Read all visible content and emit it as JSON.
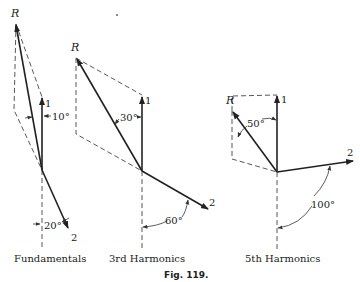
{
  "figure": {
    "caption": "Fig. 119.",
    "panels": [
      {
        "title": "Fundamentals",
        "resultant_label": "R",
        "vector1_label": "1",
        "vector2_label": "2",
        "angle_R_label": "10°",
        "angle_2_label": "20°"
      },
      {
        "title": "3rd Harmonics",
        "resultant_label": "R",
        "vector1_label": "1",
        "vector2_label": "2",
        "angle_R_label": "30°",
        "angle_2_label": "60°"
      },
      {
        "title": "5th Harmonics",
        "resultant_label": "R",
        "vector1_label": "1",
        "vector2_label": "2",
        "angle_R_label": "50°",
        "angle_2_label": "100°"
      }
    ]
  }
}
